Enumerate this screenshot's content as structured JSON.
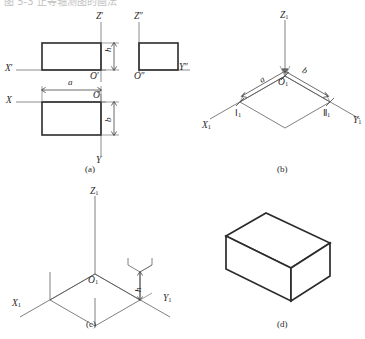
{
  "figure": {
    "clipped_header_text": "图 5-3  正等轴测图的画法",
    "panels": [
      {
        "id": "a",
        "caption": "(a)",
        "description": "three-view orthographic drawing",
        "axis_labels": [
          {
            "name": "X-prime",
            "text": "X",
            "prime": "′"
          },
          {
            "name": "Z-prime",
            "text": "Z",
            "prime": "′"
          },
          {
            "name": "O-prime",
            "text": "O",
            "prime": "′"
          },
          {
            "name": "Z-double-prime",
            "text": "Z",
            "prime": "″"
          },
          {
            "name": "O-double-prime",
            "text": "O",
            "prime": "″"
          },
          {
            "name": "Y-double-prime",
            "text": "Y",
            "prime": "″"
          },
          {
            "name": "X-axis",
            "text": "X",
            "prime": ""
          },
          {
            "name": "O-origin",
            "text": "O",
            "prime": ""
          },
          {
            "name": "Y-axis",
            "text": "Y",
            "prime": ""
          }
        ],
        "dimensions": [
          {
            "name": "height-front",
            "symbol": "h"
          },
          {
            "name": "width-plan",
            "symbol": "a"
          },
          {
            "name": "depth-plan",
            "symbol": "b"
          }
        ]
      },
      {
        "id": "b",
        "caption": "(b)",
        "description": "axonometric axes with base parallelogram laid out",
        "axis_labels": [
          {
            "name": "Z1",
            "text": "Z",
            "sub": "1"
          },
          {
            "name": "X1",
            "text": "X",
            "sub": "1"
          },
          {
            "name": "Y1",
            "text": "Y",
            "sub": "1"
          },
          {
            "name": "O1",
            "text": "O",
            "sub": "1"
          }
        ],
        "dimensions": [
          {
            "name": "width-a",
            "symbol": "a"
          },
          {
            "name": "depth-b",
            "symbol": "b"
          }
        ],
        "point_labels": [
          {
            "name": "point-one",
            "text": "Ⅰ",
            "sub": "1"
          },
          {
            "name": "point-two",
            "text": "Ⅱ",
            "sub": "1"
          }
        ]
      },
      {
        "id": "c",
        "caption": "(c)",
        "description": "vertical edges of height h erected from base corners",
        "axis_labels": [
          {
            "name": "Z1",
            "text": "Z",
            "sub": "1"
          },
          {
            "name": "X1",
            "text": "X",
            "sub": "1"
          },
          {
            "name": "Y1",
            "text": "Y",
            "sub": "1"
          },
          {
            "name": "O1",
            "text": "O",
            "sub": "1"
          }
        ],
        "dimensions": [
          {
            "name": "height-h",
            "symbol": "h"
          }
        ]
      },
      {
        "id": "d",
        "caption": "(d)",
        "description": "completed isometric box with construction lines removed",
        "axis_labels": [],
        "dimensions": []
      }
    ]
  },
  "colors": {
    "object_line": "#2b2b2b",
    "axis_line": "#6e6e6e",
    "thin_line": "#555555",
    "dimension_line": "#3a3a3a",
    "background": "#ffffff",
    "text": "#2a2a2a"
  }
}
